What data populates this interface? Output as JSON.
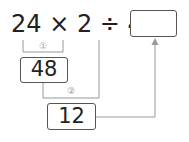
{
  "expression": {
    "text": "24 × 2 ÷ 4 =",
    "operands": [
      "24",
      "2",
      "4"
    ],
    "operators": [
      "×",
      "÷"
    ]
  },
  "answer_box": {
    "value": ""
  },
  "steps": [
    {
      "marker": "①",
      "result": "48"
    },
    {
      "marker": "②",
      "result": "12"
    }
  ],
  "colors": {
    "line": "#999999",
    "box_border": "#555555",
    "text": "#222222"
  }
}
